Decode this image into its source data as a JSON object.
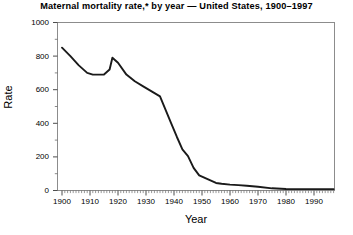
{
  "chart_data": {
    "type": "line",
    "title": "Maternal mortality rate,* by year — United States, 1900–1997",
    "xlabel": "Year",
    "ylabel": "Rate",
    "xlim": [
      1900,
      1997
    ],
    "ylim": [
      0,
      1000
    ],
    "grid": false,
    "legend": null,
    "y_ticks": [
      0,
      200,
      400,
      600,
      800,
      1000
    ],
    "y_tick_labels": [
      "0",
      "200",
      "400",
      "600",
      "800",
      "1000"
    ],
    "y_minor_tick_step": 100,
    "x_ticks": [
      1900,
      1910,
      1920,
      1930,
      1940,
      1950,
      1960,
      1970,
      1980,
      1990
    ],
    "x_tick_labels": [
      "1900",
      "1910",
      "1920",
      "1930",
      "1940",
      "1950",
      "1960",
      "1970",
      "1980",
      "1990"
    ],
    "x_minor_tick_step": 1,
    "line_color": "#1a1a1a",
    "frame_color": "#888888",
    "series": [
      {
        "name": "Maternal mortality rate",
        "x": [
          1900,
          1903,
          1906,
          1909,
          1911,
          1913,
          1915,
          1917,
          1918,
          1920,
          1923,
          1926,
          1929,
          1932,
          1935,
          1937,
          1939,
          1941,
          1943,
          1945,
          1947,
          1949,
          1951,
          1953,
          1955,
          1957,
          1960,
          1963,
          1966,
          1970,
          1975,
          1980,
          1985,
          1990,
          1997
        ],
        "values": [
          850,
          800,
          745,
          700,
          690,
          690,
          690,
          720,
          790,
          760,
          690,
          650,
          620,
          590,
          560,
          480,
          400,
          320,
          245,
          205,
          135,
          90,
          75,
          60,
          45,
          40,
          35,
          32,
          28,
          22,
          13,
          9,
          8,
          8,
          8
        ]
      }
    ]
  }
}
